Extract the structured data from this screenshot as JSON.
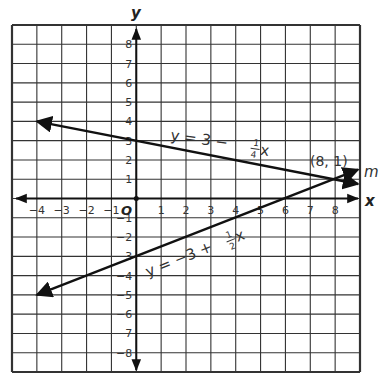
{
  "chart_data": {
    "type": "line",
    "title": "",
    "xlabel": "x",
    "ylabel": "y",
    "xlim": [
      -5,
      9
    ],
    "ylim": [
      -9,
      9
    ],
    "grid": true,
    "x_ticks": [
      -4,
      -3,
      -2,
      -1,
      1,
      2,
      3,
      4,
      5,
      6,
      7,
      8
    ],
    "y_ticks": [
      8,
      7,
      6,
      5,
      4,
      3,
      2,
      1,
      -1,
      -2,
      -3,
      -4,
      -5,
      -6,
      -7,
      -8
    ],
    "x_tick_labels": [
      "−4",
      "−3",
      "−2",
      "−1",
      "1",
      "2",
      "3",
      "4",
      "5",
      "6",
      "7",
      "8"
    ],
    "y_tick_labels": [
      "8",
      "7",
      "6",
      "5",
      "4",
      "3",
      "2",
      "1",
      "−1",
      "−2",
      "−3",
      "−4",
      "−5",
      "−6",
      "−7",
      "−8"
    ],
    "origin_label": "O",
    "series": [
      {
        "name": "y = 3 − (1/4)x",
        "equation_main": "y = 3 − ",
        "equation_frac_num": "1",
        "equation_frac_den": "4",
        "equation_var": "x",
        "slope": -0.25,
        "intercept": 3,
        "x": [
          -4,
          9
        ],
        "y": [
          4,
          0.75
        ]
      },
      {
        "name": "y = −3 + (1/2)x",
        "equation_main": "y = −3 + ",
        "equation_frac_num": "1",
        "equation_frac_den": "2",
        "equation_var": "x",
        "slope": 0.5,
        "intercept": -3,
        "label": "m",
        "x": [
          -4,
          9
        ],
        "y": [
          -5,
          1.5
        ]
      }
    ],
    "annotations": [
      {
        "text": "(8, 1)",
        "x": 8,
        "y": 1,
        "note": "intersection point"
      },
      {
        "text": "m",
        "note": "label of line y = -3 + (1/2)x"
      }
    ]
  },
  "labels": {
    "x_axis": "x",
    "y_axis": "y",
    "origin": "O",
    "intersection": "(8, 1)",
    "line_m": "m",
    "eq1_main": "y = 3 − ",
    "eq1_num": "1",
    "eq1_den": "4",
    "eq1_var": "x",
    "eq2_main": "y = −3 + ",
    "eq2_num": "1",
    "eq2_den": "2",
    "eq2_var": "x"
  },
  "colors": {
    "grid": "#333333",
    "axis": "#111111",
    "line": "#111111",
    "text": "#333333",
    "background": "#ffffff"
  }
}
